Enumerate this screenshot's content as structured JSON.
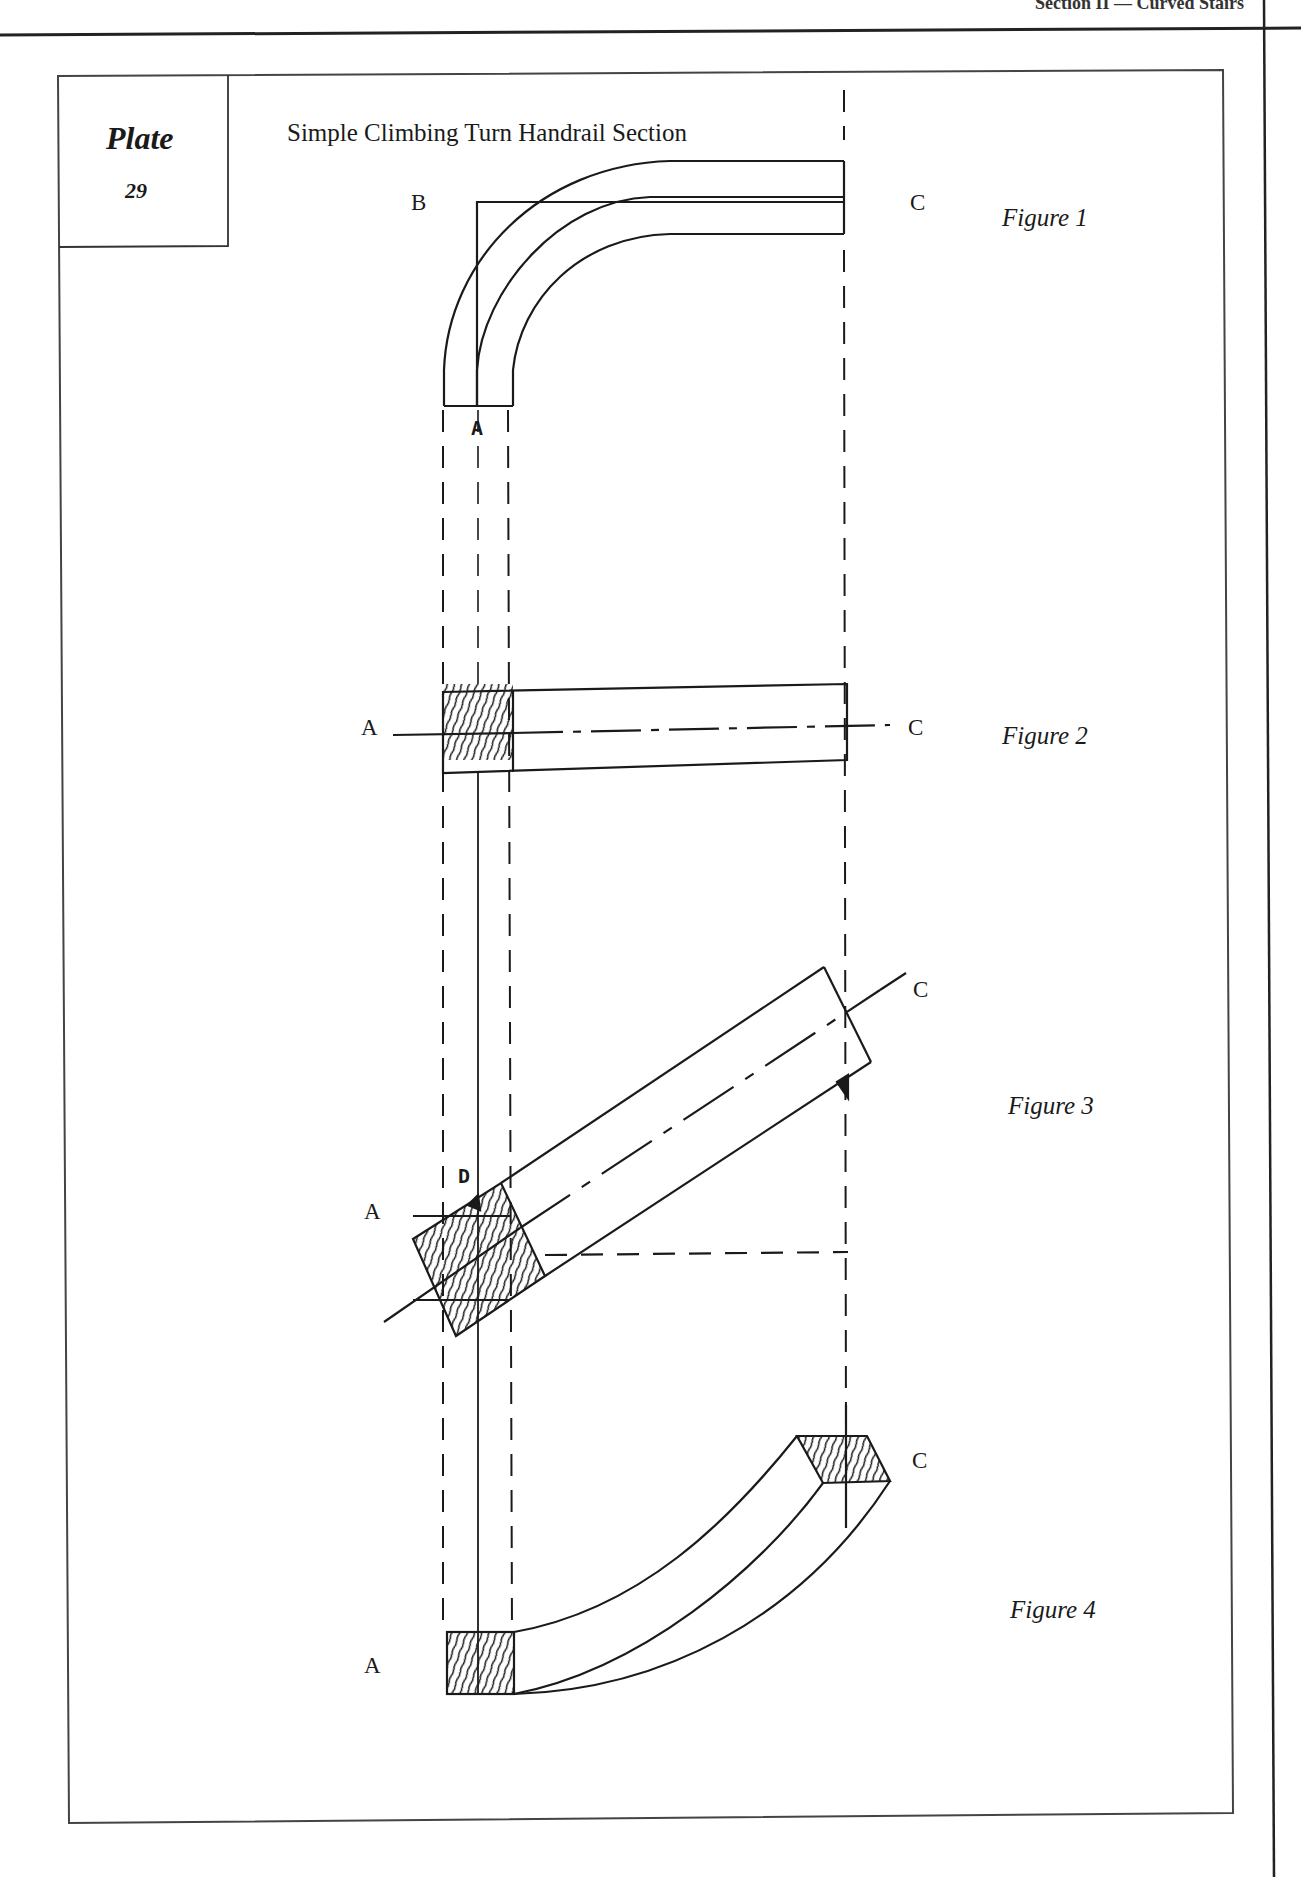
{
  "header": {
    "running_head": "Section II  —  Curved Stairs"
  },
  "plate": {
    "word": "Plate",
    "number": "29"
  },
  "title": "Simple Climbing Turn Handrail Section",
  "figures": [
    {
      "label": "Figure 1",
      "points": {
        "B": "B",
        "C": "C",
        "A": "A"
      }
    },
    {
      "label": "Figure 2",
      "points": {
        "A": "A",
        "C": "C"
      }
    },
    {
      "label": "Figure 3",
      "points": {
        "A": "A",
        "C": "C",
        "D": "D"
      }
    },
    {
      "label": "Figure 4",
      "points": {
        "A": "A",
        "C": "C"
      }
    }
  ],
  "colors": {
    "ink": "#1a1a1a",
    "paper": "#ffffff"
  }
}
